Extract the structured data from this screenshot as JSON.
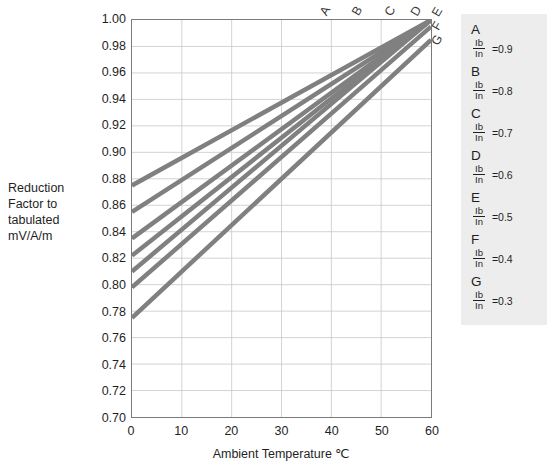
{
  "chart_data": {
    "type": "line",
    "title": "",
    "xlabel": "Ambient Temperature ℃",
    "ylabel": "Reduction Factor to tabulated mV/A/m",
    "xlim": [
      0,
      60
    ],
    "ylim": [
      0.7,
      1.0
    ],
    "grid": true,
    "legend_position": "right",
    "xticks": [
      0,
      10,
      20,
      30,
      40,
      50,
      60
    ],
    "yticks": [
      1.0,
      0.98,
      0.96,
      0.94,
      0.92,
      0.9,
      0.88,
      0.86,
      0.84,
      0.82,
      0.8,
      0.78,
      0.76,
      0.74,
      0.72,
      0.7
    ],
    "x": [
      0,
      60
    ],
    "series": [
      {
        "name": "A",
        "ratio": "0.9",
        "values": [
          0.875,
          1.0
        ],
        "label": "A"
      },
      {
        "name": "B",
        "ratio": "0.8",
        "values": [
          0.855,
          1.0
        ],
        "label": "B"
      },
      {
        "name": "C",
        "ratio": "0.7",
        "values": [
          0.835,
          1.0
        ],
        "label": "C"
      },
      {
        "name": "D",
        "ratio": "0.6",
        "values": [
          0.822,
          1.0
        ],
        "label": "D"
      },
      {
        "name": "E",
        "ratio": "0.5",
        "values": [
          0.81,
          1.0
        ],
        "label": "E"
      },
      {
        "name": "F",
        "ratio": "0.4",
        "values": [
          0.798,
          0.995
        ],
        "label": "F"
      },
      {
        "name": "G",
        "ratio": "0.3",
        "values": [
          0.775,
          0.985
        ],
        "label": "G"
      }
    ],
    "line_color": "#808080",
    "grid_color": "#c8c8c8",
    "frame_color": "#7a7a7a"
  },
  "axes": {
    "y_title": "Reduction\nFactor to\ntabulated\nmV/A/m",
    "x_title": "Ambient Temperature ℃"
  },
  "legend": {
    "numerator": "Ib",
    "denominator": "In",
    "entries": [
      {
        "letter": "A",
        "equals": "=0.9"
      },
      {
        "letter": "B",
        "equals": "=0.8"
      },
      {
        "letter": "C",
        "equals": "=0.7"
      },
      {
        "letter": "D",
        "equals": "=0.6"
      },
      {
        "letter": "E",
        "equals": "=0.5"
      },
      {
        "letter": "F",
        "equals": "=0.4"
      },
      {
        "letter": "G",
        "equals": "=0.3"
      }
    ]
  }
}
